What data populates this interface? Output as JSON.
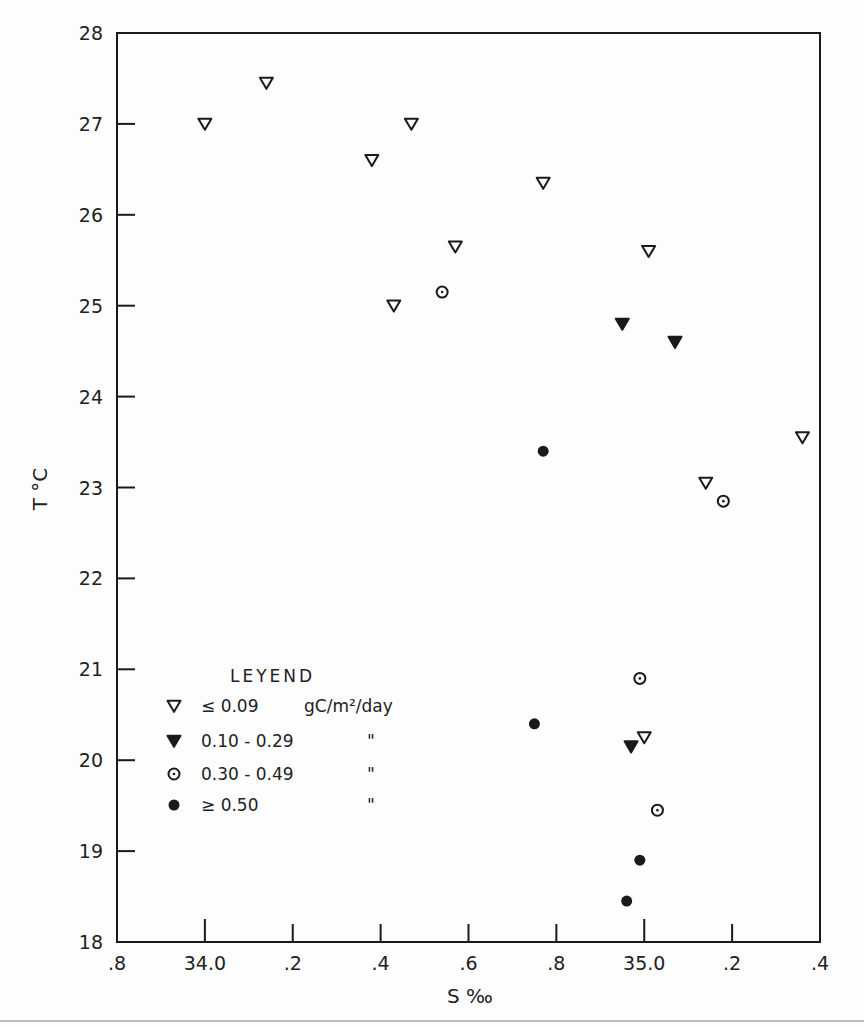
{
  "chart_data": {
    "type": "scatter",
    "title": "",
    "xlabel": "S ‰",
    "ylabel": "T °C",
    "xlim": [
      33.8,
      35.4
    ],
    "ylim": [
      18,
      28
    ],
    "grid": false,
    "x_ticks": [
      {
        "value": 33.8,
        "label": ".8"
      },
      {
        "value": 34.0,
        "label": "34.0"
      },
      {
        "value": 34.2,
        "label": ".2"
      },
      {
        "value": 34.4,
        "label": ".4"
      },
      {
        "value": 34.6,
        "label": ".6"
      },
      {
        "value": 34.8,
        "label": ".8"
      },
      {
        "value": 35.0,
        "label": "35.0"
      },
      {
        "value": 35.2,
        "label": ".2"
      },
      {
        "value": 35.4,
        "label": ".4"
      }
    ],
    "y_ticks": [
      {
        "value": 18,
        "label": "18"
      },
      {
        "value": 19,
        "label": "19"
      },
      {
        "value": 20,
        "label": "20"
      },
      {
        "value": 21,
        "label": "21"
      },
      {
        "value": 22,
        "label": "22"
      },
      {
        "value": 23,
        "label": "23"
      },
      {
        "value": 24,
        "label": "24"
      },
      {
        "value": 25,
        "label": "25"
      },
      {
        "value": 26,
        "label": "26"
      },
      {
        "value": 27,
        "label": "27"
      },
      {
        "value": 28,
        "label": "28"
      }
    ],
    "legend": {
      "title": "LEYEND",
      "position": "lower-left inside",
      "entries": [
        {
          "marker": "open-down-triangle",
          "label": "≤ 0.09",
          "unit": "gC/m²/day"
        },
        {
          "marker": "filled-down-triangle",
          "label": "0.10 - 0.29",
          "unit": "\""
        },
        {
          "marker": "dotted-circle",
          "label": "0.30 - 0.49",
          "unit": "\""
        },
        {
          "marker": "filled-circle",
          "label": "≥ 0.50",
          "unit": "\""
        }
      ]
    },
    "series": [
      {
        "name": "≤ 0.09 gC/m²/day",
        "marker": "open-down-triangle",
        "points": [
          {
            "x": 34.0,
            "y": 27.0
          },
          {
            "x": 34.14,
            "y": 27.45
          },
          {
            "x": 34.38,
            "y": 26.6
          },
          {
            "x": 34.47,
            "y": 27.0
          },
          {
            "x": 34.43,
            "y": 25.0
          },
          {
            "x": 34.57,
            "y": 25.65
          },
          {
            "x": 34.77,
            "y": 26.35
          },
          {
            "x": 35.01,
            "y": 25.6
          },
          {
            "x": 35.14,
            "y": 23.05
          },
          {
            "x": 35.36,
            "y": 23.55
          },
          {
            "x": 35.0,
            "y": 20.25
          }
        ]
      },
      {
        "name": "0.10 - 0.29 gC/m²/day",
        "marker": "filled-down-triangle",
        "points": [
          {
            "x": 34.95,
            "y": 24.8
          },
          {
            "x": 35.07,
            "y": 24.6
          },
          {
            "x": 34.97,
            "y": 20.15
          }
        ]
      },
      {
        "name": "0.30 - 0.49 gC/m²/day",
        "marker": "dotted-circle",
        "points": [
          {
            "x": 34.54,
            "y": 25.15
          },
          {
            "x": 35.18,
            "y": 22.85
          },
          {
            "x": 34.99,
            "y": 20.9
          },
          {
            "x": 35.03,
            "y": 19.45
          }
        ]
      },
      {
        "name": "≥ 0.50 gC/m²/day",
        "marker": "filled-circle",
        "points": [
          {
            "x": 34.77,
            "y": 23.4
          },
          {
            "x": 34.75,
            "y": 20.4
          },
          {
            "x": 34.99,
            "y": 18.9
          },
          {
            "x": 34.96,
            "y": 18.45
          }
        ]
      }
    ]
  },
  "colors": {
    "ink": "#1a1a1a",
    "paper": "#fdfdfd"
  }
}
